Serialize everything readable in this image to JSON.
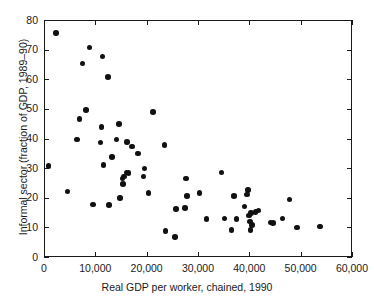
{
  "chart_data": {
    "type": "scatter",
    "title": "",
    "xlabel": "Real GDP per worker, chained, 1990",
    "ylabel": "Informal sector (fraction of GDP, 1989–90)",
    "xlim": [
      0,
      60000
    ],
    "ylim": [
      0,
      80
    ],
    "xticks": [
      0,
      10000,
      20000,
      30000,
      40000,
      50000,
      60000
    ],
    "xticklabels": [
      "0",
      "10,000",
      "20,000",
      "30,000",
      "40,000",
      "50,000",
      "60,000"
    ],
    "yticks": [
      0,
      10,
      20,
      30,
      40,
      50,
      60,
      70,
      80
    ],
    "yticklabels": [
      "0",
      "10",
      "20",
      "30",
      "40",
      "50",
      "60",
      "70",
      "80"
    ],
    "grid": false,
    "legend": null,
    "marker": {
      "shape": "circle",
      "color": "#111111",
      "size_px": 5.6
    },
    "series": [
      {
        "name": "countries",
        "points": [
          [
            700,
            31.0
          ],
          [
            2100,
            76.0
          ],
          [
            4400,
            22.4
          ],
          [
            6200,
            40.0
          ],
          [
            6700,
            46.9
          ],
          [
            7300,
            65.6
          ],
          [
            8000,
            50.0
          ],
          [
            8700,
            71.0
          ],
          [
            9400,
            18.0
          ],
          [
            10800,
            39.0
          ],
          [
            11000,
            44.3
          ],
          [
            11200,
            68.0
          ],
          [
            11400,
            31.3
          ],
          [
            12300,
            61.0
          ],
          [
            12500,
            17.8
          ],
          [
            13000,
            34.0
          ],
          [
            13900,
            40.0
          ],
          [
            14400,
            45.2
          ],
          [
            14600,
            20.2
          ],
          [
            15100,
            26.9
          ],
          [
            15200,
            25.0
          ],
          [
            15400,
            27.5
          ],
          [
            15900,
            28.9
          ],
          [
            16000,
            39.2
          ],
          [
            16300,
            28.7
          ],
          [
            16900,
            37.6
          ],
          [
            18100,
            35.3
          ],
          [
            19200,
            27.5
          ],
          [
            19400,
            30.2
          ],
          [
            20200,
            22.0
          ],
          [
            21000,
            49.2
          ],
          [
            23300,
            38.2
          ],
          [
            23500,
            9.2
          ],
          [
            25300,
            7.1
          ],
          [
            25500,
            16.6
          ],
          [
            27300,
            16.8
          ],
          [
            27500,
            26.8
          ],
          [
            27700,
            21.0
          ],
          [
            30100,
            22.0
          ],
          [
            31500,
            13.1
          ],
          [
            34400,
            28.9
          ],
          [
            35000,
            13.3
          ],
          [
            36300,
            9.4
          ],
          [
            36800,
            21.0
          ],
          [
            37300,
            13.2
          ],
          [
            38900,
            17.4
          ],
          [
            39300,
            21.4
          ],
          [
            39600,
            22.9
          ],
          [
            39700,
            14.3
          ],
          [
            39900,
            12.3
          ],
          [
            40000,
            9.4
          ],
          [
            40100,
            15.2
          ],
          [
            40300,
            11.2
          ],
          [
            41000,
            15.5
          ],
          [
            41600,
            16.0
          ],
          [
            43900,
            12.0
          ],
          [
            44400,
            11.9
          ],
          [
            46300,
            13.4
          ],
          [
            47600,
            19.8
          ],
          [
            49100,
            10.3
          ],
          [
            53600,
            10.6
          ]
        ]
      }
    ]
  },
  "axes": {
    "x_title": "Real GDP per worker, chained, 1990",
    "y_title": "Informal sector (fraction of GDP, 1989–90)",
    "x_tick_labels": [
      "0",
      "10,000",
      "20,000",
      "30,000",
      "40,000",
      "50,000",
      "60,000"
    ],
    "y_tick_labels": [
      "80",
      "70",
      "60",
      "50",
      "40",
      "30",
      "20",
      "10",
      "0"
    ]
  },
  "colors": {
    "marker": "#111111",
    "axis": "#1a1a1a",
    "background": "#ffffff"
  }
}
